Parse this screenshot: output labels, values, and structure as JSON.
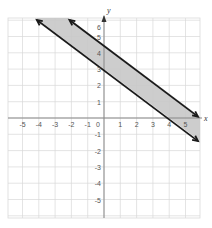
{
  "chart_data": {
    "type": "line",
    "title": "",
    "xlabel": "x",
    "ylabel": "y",
    "xlim": [
      -6,
      6
    ],
    "ylim": [
      -6,
      6.3
    ],
    "grid": true,
    "x_ticks": [
      "-5",
      "-4",
      "-3",
      "-2",
      "-1",
      "0",
      "1",
      "2",
      "3",
      "4",
      "5"
    ],
    "y_ticks": [
      "6",
      "5",
      "4",
      "3",
      "2",
      "1",
      "-1",
      "-2",
      "-3",
      "-4",
      "-5"
    ],
    "series": [
      {
        "name": "upper boundary",
        "equation": "y = -3/4 x + 4.5",
        "x": [
          -2.4,
          6
        ],
        "y": [
          6.3,
          0
        ]
      },
      {
        "name": "lower boundary",
        "equation": "y = -3/4 x + 3",
        "x": [
          -4.4,
          6
        ],
        "y": [
          6.3,
          -1.5
        ]
      }
    ],
    "shaded_region": "between the two parallel lines",
    "colors": {
      "shade": "#c8c8c8",
      "line": "#1a1a1a",
      "grid": "#d9d9d9",
      "axis": "#888888"
    }
  }
}
